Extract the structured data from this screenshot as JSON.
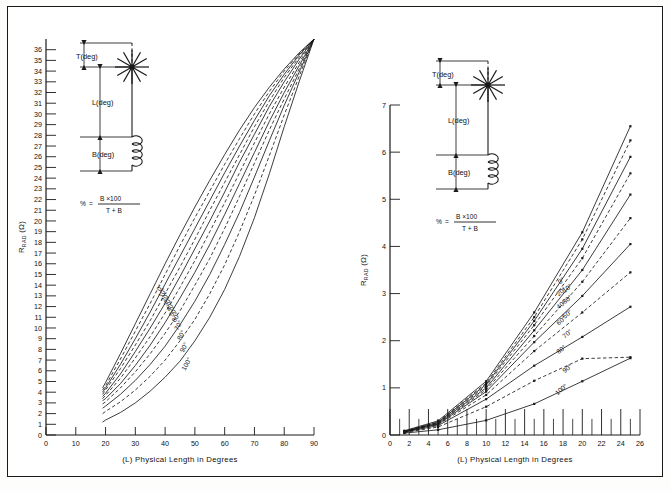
{
  "figure": {
    "background_color": "#ffffff",
    "frame_color": "#1a1a1a",
    "curve_color": "#1a1a1a",
    "bottom_caption": ""
  },
  "diagram": {
    "top_label": "T(deg)",
    "middle_label": "L(deg)",
    "bottom_label": "B(deg)",
    "formula_lhs": "%",
    "formula_eq": "=",
    "formula_num": "B ×100",
    "formula_den": "T + B"
  },
  "chart_data": [
    {
      "type": "line",
      "panel": "left",
      "title": "",
      "xlabel": "(L) Physical Length in Degrees",
      "ylabel": "R",
      "ylabel_sub": "RAD",
      "ylabel_unit": "(Ω)",
      "xlim": [
        0,
        90
      ],
      "ylim": [
        0,
        37
      ],
      "xticks": [
        0,
        10,
        20,
        30,
        40,
        50,
        60,
        70,
        80,
        90
      ],
      "yticks": [
        0,
        1,
        2,
        3,
        4,
        5,
        6,
        7,
        8,
        9,
        10,
        11,
        12,
        13,
        14,
        15,
        16,
        17,
        18,
        19,
        20,
        21,
        22,
        23,
        24,
        25,
        26,
        27,
        28,
        29,
        30,
        31,
        32,
        33,
        34,
        35,
        36
      ],
      "grid": false,
      "legend_position": "inline-curve-labels",
      "x": [
        19,
        20,
        25,
        30,
        35,
        40,
        45,
        50,
        55,
        60,
        65,
        70,
        75,
        80,
        85,
        90
      ],
      "series": [
        {
          "name": "0°",
          "style": "solid",
          "label": "0°",
          "values": [
            4.4,
            4.9,
            7.6,
            10.4,
            13.2,
            16.0,
            18.7,
            21.3,
            23.8,
            26.2,
            28.5,
            30.6,
            32.5,
            34.2,
            35.7,
            37.0
          ]
        },
        {
          "name": "10°",
          "style": "dashed",
          "label": "10°",
          "values": [
            4.2,
            4.6,
            7.1,
            9.7,
            12.3,
            15.0,
            17.7,
            20.3,
            22.8,
            25.3,
            27.7,
            30.0,
            32.1,
            34.0,
            35.6,
            37.0
          ]
        },
        {
          "name": "20°",
          "style": "solid",
          "label": "20°",
          "values": [
            4.0,
            4.4,
            6.6,
            9.0,
            11.5,
            14.1,
            16.7,
            19.3,
            21.9,
            24.5,
            27.0,
            29.4,
            31.7,
            33.7,
            35.5,
            37.0
          ]
        },
        {
          "name": "30°",
          "style": "dashed",
          "label": "30°",
          "values": [
            3.8,
            4.2,
            6.2,
            8.4,
            10.7,
            13.2,
            15.7,
            18.3,
            21.0,
            23.6,
            26.2,
            28.8,
            31.2,
            33.4,
            35.3,
            37.0
          ]
        },
        {
          "name": "40°",
          "style": "solid",
          "label": "40°",
          "values": [
            3.6,
            3.9,
            5.7,
            7.8,
            10.0,
            12.3,
            14.8,
            17.4,
            20.0,
            22.7,
            25.5,
            28.1,
            30.7,
            33.0,
            35.1,
            37.0
          ]
        },
        {
          "name": "50°",
          "style": "dashed",
          "label": "50°",
          "values": [
            3.4,
            3.7,
            5.3,
            7.2,
            9.2,
            11.4,
            13.8,
            16.3,
            19.0,
            21.7,
            24.5,
            27.3,
            30.0,
            32.5,
            34.8,
            37.0
          ]
        },
        {
          "name": "60°",
          "style": "solid",
          "label": "60°",
          "values": [
            3.2,
            3.4,
            4.8,
            6.5,
            8.4,
            10.5,
            12.8,
            15.2,
            17.8,
            20.6,
            23.5,
            26.4,
            29.3,
            32.0,
            34.5,
            37.0
          ]
        },
        {
          "name": "70°",
          "style": "dashed",
          "label": "70°",
          "values": [
            2.9,
            3.1,
            4.4,
            5.9,
            7.6,
            9.5,
            11.6,
            14.0,
            16.5,
            19.3,
            22.3,
            25.4,
            28.5,
            31.4,
            34.2,
            37.0
          ]
        },
        {
          "name": "80°",
          "style": "solid",
          "label": "80°",
          "values": [
            2.5,
            2.7,
            3.8,
            5.1,
            6.6,
            8.3,
            10.3,
            12.5,
            15.0,
            17.8,
            20.8,
            24.1,
            27.5,
            30.8,
            33.9,
            37.0
          ]
        },
        {
          "name": "90°",
          "style": "dashed",
          "label": "90°",
          "values": [
            2.0,
            2.2,
            3.1,
            4.2,
            5.5,
            7.0,
            8.8,
            10.8,
            13.2,
            15.9,
            19.0,
            22.4,
            26.1,
            29.9,
            33.5,
            37.0
          ]
        },
        {
          "name": "100°",
          "style": "solid",
          "label": "100°",
          "values": [
            1.2,
            1.4,
            2.1,
            3.0,
            4.1,
            5.4,
            6.9,
            8.8,
            11.0,
            13.6,
            16.7,
            20.3,
            24.4,
            28.8,
            33.0,
            37.0
          ]
        }
      ]
    },
    {
      "type": "line",
      "panel": "right",
      "title": "",
      "xlabel": "(L) Physical Length in Degrees",
      "ylabel": "R",
      "ylabel_sub": "RAD",
      "ylabel_unit": "(Ω)",
      "xlim": [
        0,
        26
      ],
      "ylim": [
        0,
        7
      ],
      "xticks": [
        0,
        2,
        4,
        6,
        8,
        10,
        12,
        14,
        16,
        18,
        20,
        22,
        24,
        26
      ],
      "yticks": [
        0,
        1,
        2,
        3,
        4,
        5,
        6,
        7
      ],
      "grid": false,
      "legend_position": "inline-curve-labels",
      "markers": true,
      "x": [
        1.5,
        5,
        10,
        15,
        20,
        25
      ],
      "series": [
        {
          "name": "0°",
          "style": "solid",
          "label": "0°",
          "values": [
            0.09,
            0.3,
            1.14,
            2.6,
            4.3,
            6.55
          ]
        },
        {
          "name": "10°",
          "style": "dashed",
          "label": "10°",
          "values": [
            0.08,
            0.28,
            1.1,
            2.5,
            4.15,
            6.25
          ]
        },
        {
          "name": "20°",
          "style": "solid",
          "label": "20°",
          "values": [
            0.08,
            0.27,
            1.07,
            2.42,
            3.95,
            5.9
          ]
        },
        {
          "name": "30°",
          "style": "dashed",
          "label": "30°",
          "values": [
            0.08,
            0.26,
            1.04,
            2.33,
            3.75,
            5.55
          ]
        },
        {
          "name": "40°",
          "style": "solid",
          "label": "40°",
          "values": [
            0.07,
            0.25,
            1.0,
            2.22,
            3.5,
            5.1
          ]
        },
        {
          "name": "50°",
          "style": "dashed",
          "label": "50°",
          "values": [
            0.07,
            0.24,
            0.96,
            2.1,
            3.25,
            4.6
          ]
        },
        {
          "name": "60°",
          "style": "solid",
          "label": "60°",
          "values": [
            0.07,
            0.23,
            0.92,
            1.97,
            2.95,
            4.05
          ]
        },
        {
          "name": "70°",
          "style": "dashed",
          "label": "70°",
          "values": [
            0.06,
            0.22,
            0.85,
            1.78,
            2.6,
            3.45
          ]
        },
        {
          "name": "80°",
          "style": "solid",
          "label": "80°",
          "values": [
            0.06,
            0.2,
            0.76,
            1.47,
            2.08,
            2.72
          ]
        },
        {
          "name": "90°",
          "style": "dashed",
          "label": "90°",
          "values": [
            0.05,
            0.17,
            0.6,
            1.15,
            1.62,
            1.65
          ]
        },
        {
          "name": "100°",
          "style": "solid",
          "label": "100°",
          "values": [
            0.04,
            0.11,
            0.31,
            0.66,
            1.14,
            1.63
          ]
        }
      ]
    }
  ]
}
